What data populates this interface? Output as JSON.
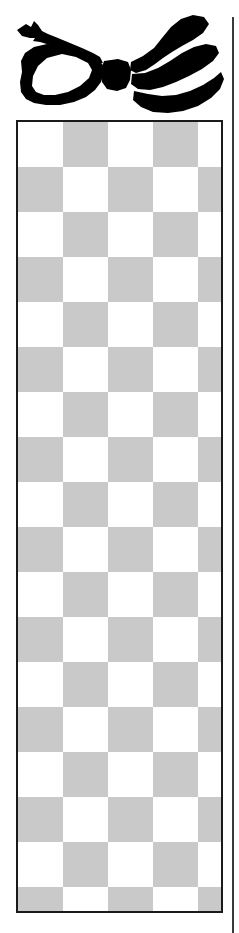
{
  "page": {
    "background_color": "#ffffff",
    "width": 239,
    "height": 933
  },
  "illustration": {
    "name": "ribbon-bow",
    "description": "Black silhouette of a tied ribbon bow with two loops and a central knot",
    "fill_color": "#000000",
    "x": 0,
    "y": 0,
    "width": 225,
    "height": 118
  },
  "right_rule": {
    "name": "vertical-margin-rule",
    "color": "#3a3a3a",
    "x": 232,
    "y": 17,
    "width": 2,
    "height": 916
  },
  "checkerboard": {
    "name": "checkerboard-panel",
    "border_color": "#1a1a1a",
    "border_width": 2,
    "light_color": "#ffffff",
    "dark_color": "#c9c9c9",
    "cell_size": 45,
    "columns": 5,
    "rows": 18,
    "x": 16,
    "y": 120,
    "width": 207,
    "height": 793,
    "start_parity": 0
  }
}
